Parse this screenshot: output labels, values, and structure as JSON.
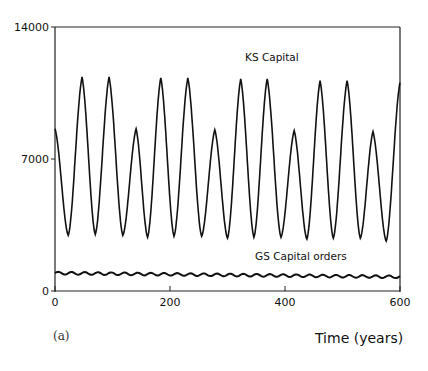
{
  "chart_data": {
    "type": "line",
    "title": "",
    "panel_label": "(a)",
    "xlabel": "Time (years)",
    "ylabel": "",
    "xlim": [
      0,
      600
    ],
    "ylim": [
      0,
      14000
    ],
    "x_ticks": [
      0,
      200,
      400,
      600
    ],
    "x_tick_labels": [
      "0",
      "200",
      "400",
      "600"
    ],
    "y_ticks": [
      0,
      7000,
      14000
    ],
    "y_tick_labels": [
      "0",
      "7000",
      "14000"
    ],
    "grid": false,
    "legend": "inline annotations",
    "series": [
      {
        "name": "KS Capital",
        "label_position": [
          300,
          12300
        ],
        "peaks": [
          {
            "t": 0,
            "value": 8600
          },
          {
            "t": 47,
            "value": 11350
          },
          {
            "t": 94,
            "value": 11350
          },
          {
            "t": 141,
            "value": 8600
          },
          {
            "t": 184,
            "value": 11300
          },
          {
            "t": 231,
            "value": 11300
          },
          {
            "t": 278,
            "value": 8550
          },
          {
            "t": 323,
            "value": 11250
          },
          {
            "t": 369,
            "value": 11250
          },
          {
            "t": 416,
            "value": 8500
          },
          {
            "t": 461,
            "value": 11150
          },
          {
            "t": 508,
            "value": 11150
          },
          {
            "t": 553,
            "value": 8450
          },
          {
            "t": 600,
            "value": 11050
          }
        ],
        "troughs": [
          {
            "t": 23,
            "value": 2950
          },
          {
            "t": 70,
            "value": 3000
          },
          {
            "t": 118,
            "value": 2950
          },
          {
            "t": 161,
            "value": 2850
          },
          {
            "t": 207,
            "value": 2900
          },
          {
            "t": 255,
            "value": 2900
          },
          {
            "t": 300,
            "value": 2800
          },
          {
            "t": 346,
            "value": 2850
          },
          {
            "t": 393,
            "value": 2850
          },
          {
            "t": 438,
            "value": 2750
          },
          {
            "t": 484,
            "value": 2800
          },
          {
            "t": 531,
            "value": 2800
          },
          {
            "t": 576,
            "value": 2650
          }
        ]
      },
      {
        "name": "GS Capital orders",
        "label_position": [
          300,
          1850
        ],
        "start_value": 950,
        "end_value": 750,
        "oscillation_amplitude": 70,
        "oscillation_period_years": 23
      }
    ]
  }
}
